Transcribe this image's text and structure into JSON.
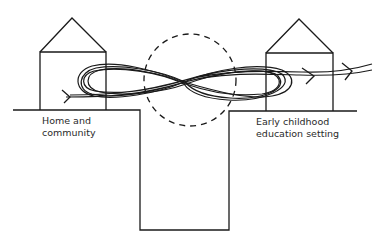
{
  "diagram": {
    "type": "illustration",
    "labels": {
      "left": {
        "line1": "Home and",
        "line2": "community"
      },
      "right": {
        "line1": "Early childhood",
        "line2": "education setting"
      }
    },
    "colors": {
      "stroke": "#1a1a1a",
      "text": "#2a2a2a",
      "background": "#ffffff"
    }
  }
}
